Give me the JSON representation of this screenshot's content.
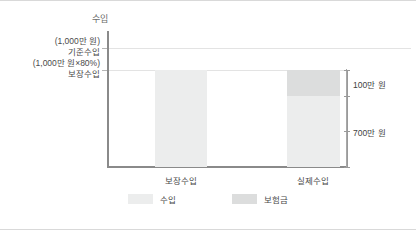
{
  "chart_data": {
    "type": "bar",
    "title": "",
    "ylabel": "수입",
    "xlabel": "",
    "categories": [
      "보장수입",
      "실제수입"
    ],
    "series": [
      {
        "name": "수입",
        "values": [
          800,
          700
        ]
      },
      {
        "name": "보험금",
        "values": [
          0,
          100
        ]
      }
    ],
    "unit": "만 원",
    "stacked": true,
    "grid": true,
    "legend_position": "bottom",
    "ylim": [
      0,
      1000
    ],
    "y_ticks": [
      {
        "value": 1000,
        "line1": "(1,000만 원)",
        "line2": "기준수입"
      },
      {
        "value": 800,
        "line1": "(1,000만 원×80%)",
        "line2": "보장수입"
      }
    ],
    "annotations": [
      {
        "text": "100만 원",
        "refers_to": "보험금",
        "value": 100
      },
      {
        "text": "700만 원",
        "refers_to": "수입",
        "value": 700
      }
    ],
    "colors": {
      "income": "#eceded",
      "insurance": "#dcdddd",
      "axis": "#8a8a8a",
      "grid": "#e3e3e3",
      "text": "#4a4a4a"
    }
  },
  "axis": {
    "y_title": "수입"
  },
  "legend": {
    "items": [
      {
        "label": "수입"
      },
      {
        "label": "보험금"
      }
    ]
  }
}
